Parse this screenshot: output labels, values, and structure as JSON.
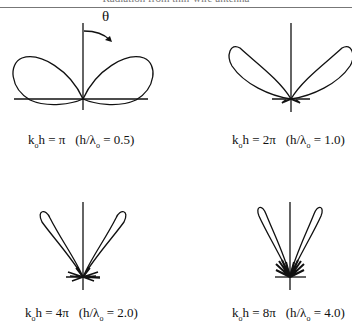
{
  "header": {
    "title": "Radiation from thin-wire antenna"
  },
  "theta_label": "θ",
  "panels": [
    {
      "k0h": "π",
      "h_over_lambda": "0.5",
      "label_left": "k",
      "label_sub": "o",
      "label_mid": "h = π",
      "label_paren": "(h/λ",
      "label_paren_sub": "o",
      "label_paren_end": " = 0.5)"
    },
    {
      "k0h": "2π",
      "h_over_lambda": "1.0",
      "label_left": "k",
      "label_sub": "o",
      "label_mid": "h = 2π",
      "label_paren": "(h/λ",
      "label_paren_sub": "o",
      "label_paren_end": " = 1.0)"
    },
    {
      "k0h": "4π",
      "h_over_lambda": "2.0",
      "label_left": "k",
      "label_sub": "o",
      "label_mid": "h = 4π",
      "label_paren": "(h/λ",
      "label_paren_sub": "o",
      "label_paren_end": " = 2.0)"
    },
    {
      "k0h": "8π",
      "h_over_lambda": "4.0",
      "label_left": "k",
      "label_sub": "o",
      "label_mid": "h = 8π",
      "label_paren": "(h/λ",
      "label_paren_sub": "o",
      "label_paren_end": " = 4.0)"
    }
  ],
  "colors": {
    "line": "#111111",
    "header": "#777777"
  }
}
